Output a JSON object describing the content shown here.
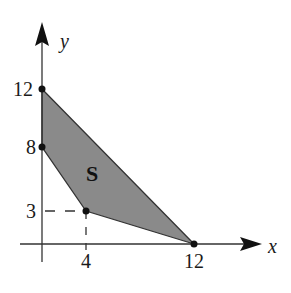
{
  "diagram": {
    "type": "feasible-region",
    "region": {
      "label": "S",
      "vertices": [
        [
          0,
          12
        ],
        [
          12,
          0
        ],
        [
          4,
          3
        ],
        [
          0,
          8
        ]
      ],
      "fill_color": "#8a8a8a",
      "edge_color": "#333333"
    },
    "axes": {
      "x_label": "x",
      "y_label": "y",
      "color": "#333333"
    },
    "points": [
      {
        "name": "point-0-12",
        "x": 0,
        "y": 12
      },
      {
        "name": "point-0-8",
        "x": 0,
        "y": 8
      },
      {
        "name": "point-4-3",
        "x": 4,
        "y": 3
      },
      {
        "name": "point-12-0",
        "x": 12,
        "y": 0
      }
    ],
    "ticks": {
      "x": [
        "4",
        "12"
      ],
      "y": [
        "12",
        "8",
        "3"
      ]
    },
    "point_color": "#111111"
  }
}
